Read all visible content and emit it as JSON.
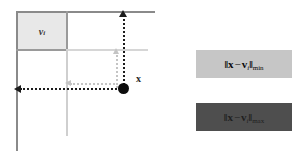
{
  "figure": {
    "name": "nearest-farthest-distance-diagram",
    "background_color": "#ffffff"
  },
  "diagram": {
    "cell_label": "v",
    "cell_label_index": "i",
    "point_label": "x",
    "cell_fill_color": "#e8e8e8",
    "axis_color": "#8a8a8a",
    "grid_color": "#d6d6d6",
    "arrow_color_dark": "#1c1c1c",
    "arrow_color_light": "#c4c4c4",
    "point_color": "#0d0d0d"
  },
  "formulas": [
    {
      "id": "min-distance",
      "norm_open": "‖",
      "lhs": "x",
      "operator": "−",
      "rhs": "v",
      "rhs_index": "i",
      "norm_close": "‖",
      "subscript": "min",
      "box_color": "#c6c6c6",
      "text_color": "#0a0a0a"
    },
    {
      "id": "max-distance",
      "norm_open": "‖",
      "lhs": "x",
      "operator": "−",
      "rhs": "v",
      "rhs_index": "i",
      "norm_close": "‖",
      "subscript": "max",
      "box_color": "#4e4e4e",
      "text_color": "#1f1f1f"
    }
  ]
}
